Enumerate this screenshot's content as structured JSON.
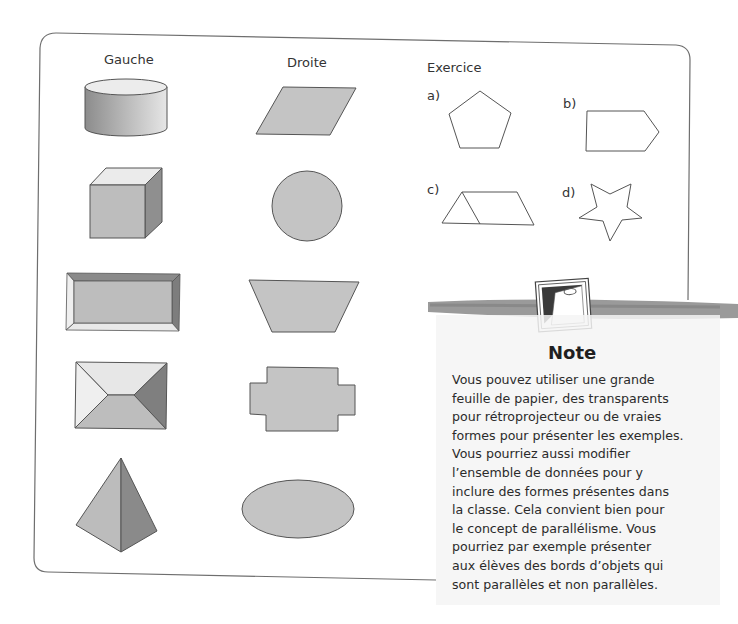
{
  "page": {
    "columns": {
      "left_header": "Gauche",
      "right_header": "Droite",
      "exercise_header": "Exercice"
    },
    "left_shapes": [
      {
        "name": "cylinder",
        "fill": "#a9a9a9"
      },
      {
        "name": "cube",
        "fill": "#bcbcbc"
      },
      {
        "name": "rectangular-prism-frame",
        "fill": "#bdbdbd"
      },
      {
        "name": "rectangular-pyramid-top-view",
        "fill": "#bdbdbd"
      },
      {
        "name": "triangular-pyramid",
        "fill": "#b8b8b8"
      }
    ],
    "right_shapes": [
      {
        "name": "parallelogram",
        "fill": "#c4c4c4"
      },
      {
        "name": "circle",
        "fill": "#c4c4c4"
      },
      {
        "name": "trapezoid",
        "fill": "#c4c4c4"
      },
      {
        "name": "cross-polygon",
        "fill": "#c4c4c4"
      },
      {
        "name": "ellipse",
        "fill": "#c4c4c4"
      }
    ],
    "exercise_items": [
      {
        "label": "a)",
        "shape": "pentagon"
      },
      {
        "label": "b)",
        "shape": "pentagon-arrow"
      },
      {
        "label": "c)",
        "shape": "trapezoid-with-triangle"
      },
      {
        "label": "d)",
        "shape": "star"
      }
    ],
    "note": {
      "title": "Note",
      "icon": "notepad-with-paperclip-icon",
      "lines": [
        "Vous pouvez utiliser une grande",
        "feuille de papier, des transparents",
        "pour rétroprojecteur ou de vraies",
        "formes pour présenter les exemples.",
        "Vous pourriez aussi modifier",
        "l’ensemble de données pour y",
        "inclure des formes présentes dans",
        "la classe. Cela convient bien pour",
        "le concept de parallélisme. Vous",
        "pourriez par exemple présenter",
        "aux élèves des bords d’objets qui",
        "sont parallèles et non parallèles."
      ]
    },
    "colors": {
      "frame_stroke": "#6e6e6e",
      "shape_stroke": "#555555",
      "brush_stroke": "#8a8a8a"
    }
  }
}
